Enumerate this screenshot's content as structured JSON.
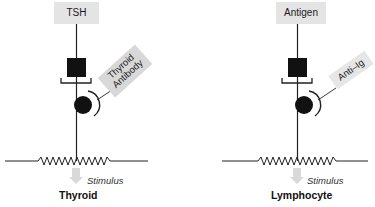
{
  "diagram": {
    "left_panel": {
      "ligand_label": "TSH",
      "antibody_label_line1": "Thyroid",
      "antibody_label_line2": "Antibody",
      "stimulus_label": "Stimulus",
      "cell_label": "Thyroid"
    },
    "right_panel": {
      "ligand_label": "Antigen",
      "antibody_label": "Anti–Ig",
      "stimulus_label": "Stimulus",
      "cell_label": "Lymphocyte"
    },
    "colors": {
      "label_box": "#e4e4e4",
      "receptor": "#111111",
      "line": "#222222",
      "arrow": "#d9d9d9"
    }
  }
}
